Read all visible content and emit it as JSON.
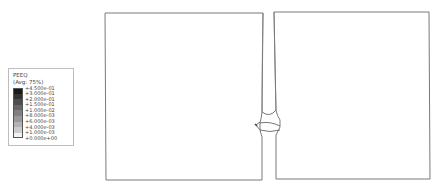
{
  "legend": {
    "variable": "PEEQ",
    "averaging": "(Avg: 75%)",
    "labels": [
      "+4.500e-01",
      "+3.000e-01",
      "+2.000e-01",
      "+1.500e-01",
      "+1.000e-02",
      "+8.000e-03",
      "+6.000e-03",
      "+4.000e-03",
      "+1.000e-03",
      "+0.000e+00"
    ],
    "colors": [
      "#1a1a1a",
      "#333333",
      "#4d4d4d",
      "#666666",
      "#808080",
      "#999999",
      "#b3b3b3",
      "#cccccc",
      "#f2f2f2"
    ]
  },
  "geometry": {
    "left_block": "left-plate",
    "right_block": "right-plate",
    "weld": "weld-bead",
    "line_color": "#7a7a7a"
  }
}
